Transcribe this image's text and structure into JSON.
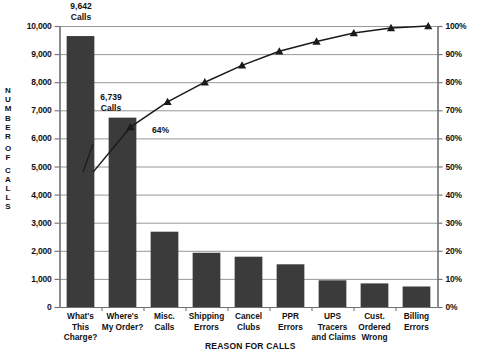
{
  "chart_data": {
    "type": "bar",
    "title": "",
    "xlabel": "REASON FOR CALLS",
    "ylabel": "NUMBER OF CALLS",
    "ylabel_letters": [
      "N",
      "U",
      "M",
      "B",
      "E",
      "R",
      "",
      "O",
      "F",
      "",
      "C",
      "A",
      "L",
      "L",
      "S"
    ],
    "y2label": "",
    "grid": true,
    "legend": "none",
    "categories": [
      "What's This Charge?",
      "Where's My Order?",
      "Misc. Calls",
      "Shipping Errors",
      "Cancel Clubs",
      "PPR Errors",
      "UPS Tracers and Claims",
      "Cust. Ordered Wrong",
      "Billing Errors"
    ],
    "category_lines": [
      [
        "What's",
        "This",
        "Charge?"
      ],
      [
        "Where's",
        "My Order?"
      ],
      [
        "Misc.",
        "Calls"
      ],
      [
        "Shipping",
        "Errors"
      ],
      [
        "Cancel",
        "Clubs"
      ],
      [
        "PPR",
        "Errors"
      ],
      [
        "UPS",
        "Tracers",
        "and Claims"
      ],
      [
        "Cust.",
        "Ordered",
        "Wrong"
      ],
      [
        "Billing",
        "Errors"
      ]
    ],
    "values": [
      9642,
      6739,
      2680,
      1930,
      1790,
      1520,
      950,
      840,
      730
    ],
    "ylim": [
      0,
      10000
    ],
    "ytick_values": [
      0,
      1000,
      2000,
      3000,
      4000,
      5000,
      6000,
      7000,
      8000,
      9000,
      10000
    ],
    "ytick_labels": [
      "0",
      "1,000",
      "2,000",
      "3,000",
      "4,000",
      "5,000",
      "6,000",
      "7,000",
      "8,000",
      "9,000",
      "10,000"
    ],
    "y2lim": [
      0,
      100
    ],
    "y2tick_values": [
      0,
      10,
      20,
      30,
      40,
      50,
      60,
      70,
      80,
      90,
      100
    ],
    "y2tick_labels": [
      "0%",
      "10%",
      "20%",
      "30%",
      "40%",
      "50%",
      "60%",
      "70%",
      "80%",
      "90%",
      "100%"
    ],
    "cumulative_percent": [
      48,
      82,
      89.6,
      95,
      98.5,
      100,
      100,
      100,
      100
    ],
    "cumulative_series": {
      "name": "Cumulative %",
      "marker": "triangle",
      "points_pct": [
        48,
        64,
        73,
        80,
        86,
        91,
        94.5,
        97.5,
        99.3,
        100
      ]
    },
    "annotations": [
      {
        "name": "bar-1-value",
        "lines": [
          "9,642",
          "Calls"
        ],
        "target_category": "What's This Charge?"
      },
      {
        "name": "bar-2-value",
        "lines": [
          "6,739",
          "Calls"
        ],
        "target_category": "Where's My Order?"
      },
      {
        "name": "cumulative-callout",
        "text": "64%"
      }
    ]
  },
  "colors": {
    "bar_fill": "#3b3b3b",
    "line": "#1a1a1a",
    "grid": "#8c8c8c",
    "axis": "#6f6f6f",
    "text": "#111111",
    "background": "#ffffff"
  }
}
